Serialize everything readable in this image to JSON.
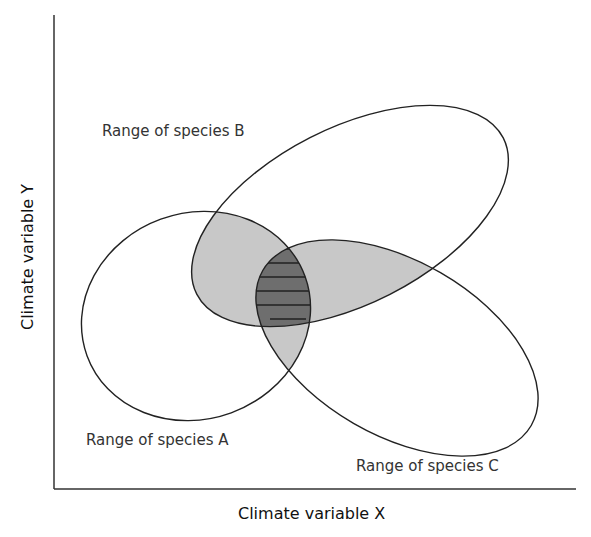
{
  "figure": {
    "x_axis_label": "Climate variable X",
    "y_axis_label": "Climate variable Y",
    "ranges": [
      {
        "id": "A",
        "label": "Range of species A"
      },
      {
        "id": "B",
        "label": "Range of species B"
      },
      {
        "id": "C",
        "label": "Range of species C"
      }
    ],
    "colors": {
      "pairwise_overlap": "#c8c8c8",
      "triple_overlap": "#6e6e6e",
      "outline": "#222222"
    }
  }
}
